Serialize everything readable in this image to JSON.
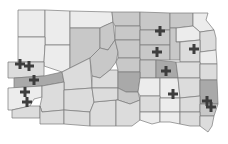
{
  "map": {
    "region": "South Dakota",
    "subdivision": "counties",
    "shading_levels": {
      "none": "#ececec",
      "light": "#dcdcdc",
      "medium": "#c8c8c8",
      "dark": "#a9a9a9"
    },
    "marker_symbol": "cross",
    "marker_color": "#3d3d3d",
    "marker_count": 12
  }
}
